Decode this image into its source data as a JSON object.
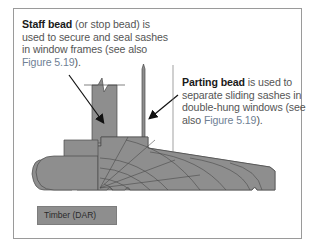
{
  "figure": {
    "colors": {
      "frame_border": "#9a9a9a",
      "timber_fill": "#8e8e8e",
      "outline": "#4a4a4a",
      "callout_text": "#555555",
      "callout_bold": "#1a1a1a",
      "figure_ref": "#6f7f95"
    }
  },
  "callouts": {
    "staff_bead": {
      "term": "Staff bead",
      "text_1": " (or stop bead) is used to secure and seal sashes in window frames (see also ",
      "ref": "Figure 5.19",
      "text_2": ")."
    },
    "parting_bead": {
      "term": "Parting bead",
      "text_1": " is used to separate sliding sashes in double-hung windows (see also ",
      "ref": "Figure 5.19",
      "text_2": ")."
    }
  },
  "legend": {
    "items": [
      {
        "label": "Timber (DAR)",
        "color": "#8e8e8e"
      }
    ]
  }
}
